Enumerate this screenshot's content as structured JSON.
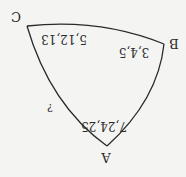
{
  "diagram": {
    "rotation_deg": 180,
    "line_color": "#2a2a2a",
    "background": "#f4f4f2",
    "vertices": [
      {
        "label": "A",
        "x": 107,
        "y": 146
      },
      {
        "label": "B",
        "x": 164,
        "y": 44
      },
      {
        "label": "C",
        "x": 27,
        "y": 26
      }
    ],
    "angle_labels": [
      {
        "vertex": "A",
        "text": "7,24,25"
      },
      {
        "vertex": "B",
        "text": "3,4,5"
      },
      {
        "vertex": "C",
        "text": "5,12,13"
      }
    ],
    "side_labels": [
      {
        "side": "AC",
        "text": "?"
      }
    ]
  }
}
